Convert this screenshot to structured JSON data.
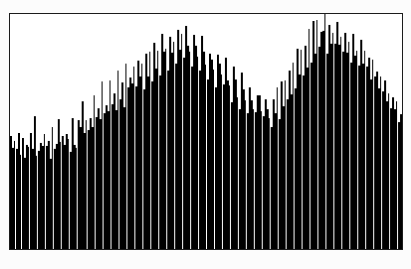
{
  "figure": {
    "background_color": "#fcfcfc",
    "frame_color": "#1b1b1b",
    "fill_color": "#000000",
    "gap_color": "#ffffff",
    "frame": {
      "x": 9,
      "y": 13,
      "width": 394,
      "height": 237
    }
  },
  "chart_data": {
    "type": "bar",
    "title": "",
    "subtitle": "",
    "xlabel": "",
    "ylabel": "",
    "legend": [],
    "annotations": [],
    "grid": false,
    "axis_ticks_visible": false,
    "tick_labels_x": [],
    "tick_labels_y": [],
    "xlim": [
      0,
      197
    ],
    "ylim": [
      0,
      100
    ],
    "bar_count": 197,
    "envelope": {
      "shape": "two-hump-sinusoid",
      "peak1_index": 59,
      "peak2_index": 157,
      "valley_index": 110,
      "baseline_level": 42,
      "peak_level": 88
    },
    "categories": [
      0,
      1,
      2,
      3,
      4,
      5,
      6,
      7,
      8,
      9,
      10,
      11,
      12,
      13,
      14,
      15,
      16,
      17,
      18,
      19,
      20,
      21,
      22,
      23,
      24,
      25,
      26,
      27,
      28,
      29,
      30,
      31,
      32,
      33,
      34,
      35,
      36,
      37,
      38,
      39,
      40,
      41,
      42,
      43,
      44,
      45,
      46,
      47,
      48,
      49,
      50,
      51,
      52,
      53,
      54,
      55,
      56,
      57,
      58,
      59,
      60,
      61,
      62,
      63,
      64,
      65,
      66,
      67,
      68,
      69,
      70,
      71,
      72,
      73,
      74,
      75,
      76,
      77,
      78,
      79,
      80,
      81,
      82,
      83,
      84,
      85,
      86,
      87,
      88,
      89,
      90,
      91,
      92,
      93,
      94,
      95,
      96,
      97,
      98,
      99,
      100,
      101,
      102,
      103,
      104,
      105,
      106,
      107,
      108,
      109,
      110,
      111,
      112,
      113,
      114,
      115,
      116,
      117,
      118,
      119,
      120,
      121,
      122,
      123,
      124,
      125,
      126,
      127,
      128,
      129,
      130,
      131,
      132,
      133,
      134,
      135,
      136,
      137,
      138,
      139,
      140,
      141,
      142,
      143,
      144,
      145,
      146,
      147,
      148,
      149,
      150,
      151,
      152,
      153,
      154,
      155,
      156,
      157,
      158,
      159,
      160,
      161,
      162,
      163,
      164,
      165,
      166,
      167,
      168,
      169,
      170,
      171,
      172,
      173,
      174,
      175,
      176,
      177,
      178,
      179,
      180,
      181,
      182,
      183,
      184,
      185,
      186,
      187,
      188,
      189,
      190,
      191,
      192,
      193,
      194,
      195,
      196
    ],
    "values": [
      47,
      41,
      44,
      40,
      52,
      42,
      46,
      39,
      45,
      43,
      49,
      41,
      55,
      40,
      44,
      48,
      42,
      50,
      43,
      46,
      41,
      53,
      45,
      42,
      57,
      44,
      48,
      43,
      51,
      46,
      44,
      58,
      47,
      45,
      52,
      49,
      61,
      48,
      54,
      50,
      57,
      52,
      66,
      55,
      60,
      53,
      70,
      58,
      63,
      56,
      72,
      61,
      67,
      59,
      76,
      64,
      69,
      62,
      78,
      66,
      73,
      68,
      80,
      71,
      83,
      74,
      77,
      70,
      86,
      75,
      82,
      72,
      88,
      79,
      84,
      76,
      90,
      81,
      86,
      78,
      92,
      83,
      88,
      80,
      95,
      85,
      90,
      82,
      97,
      87,
      84,
      79,
      93,
      86,
      81,
      77,
      89,
      83,
      78,
      74,
      86,
      80,
      75,
      71,
      82,
      77,
      72,
      68,
      79,
      74,
      69,
      65,
      76,
      71,
      66,
      62,
      73,
      68,
      64,
      60,
      70,
      66,
      61,
      58,
      68,
      63,
      59,
      56,
      65,
      61,
      57,
      54,
      63,
      59,
      66,
      56,
      70,
      61,
      74,
      64,
      77,
      67,
      80,
      70,
      83,
      73,
      86,
      76,
      89,
      79,
      92,
      82,
      95,
      85,
      98,
      88,
      94,
      90,
      100,
      86,
      97,
      89,
      93,
      85,
      96,
      88,
      91,
      83,
      94,
      86,
      89,
      81,
      92,
      84,
      87,
      79,
      90,
      82,
      85,
      77,
      83,
      75,
      80,
      72,
      77,
      69,
      74,
      66,
      71,
      63,
      68,
      60,
      65,
      57,
      62,
      54,
      59
    ],
    "gap_indices": [
      2,
      5,
      9,
      13,
      17,
      21,
      25,
      29,
      33,
      38,
      42,
      46,
      50,
      54,
      58,
      62,
      66,
      70,
      74,
      78,
      82,
      86,
      90,
      94,
      98,
      102,
      106,
      110,
      114,
      118,
      122,
      126,
      130,
      134,
      138,
      142,
      146,
      150,
      154,
      158,
      162,
      166,
      170,
      174,
      178,
      182,
      186,
      190,
      194
    ]
  }
}
